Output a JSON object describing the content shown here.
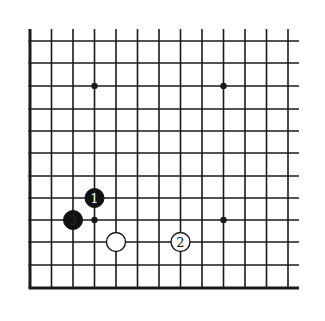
{
  "diagram": {
    "type": "go-board-partial",
    "board_color": "#ffffff",
    "line_color": "#1a1a1a",
    "grid": {
      "x_lines": [
        30,
        51.5,
        73,
        94.5,
        116,
        137.5,
        159,
        180.5,
        202,
        223.5,
        245,
        266.5,
        288
      ],
      "y_lines": [
        41,
        63,
        86,
        109,
        131,
        153,
        176,
        198,
        220,
        242,
        265,
        288
      ],
      "top_edge_y": 29,
      "right_edge_x": 299,
      "open_edges": [
        "top",
        "right"
      ],
      "thick_edges": [
        "left",
        "bottom"
      ]
    },
    "star_points": [
      {
        "col": 3,
        "row": 2
      },
      {
        "col": 9,
        "row": 2
      },
      {
        "col": 3,
        "row": 8
      },
      {
        "col": 9,
        "row": 8
      }
    ],
    "stones": [
      {
        "color": "black",
        "col": 3,
        "row": 7,
        "label": "1"
      },
      {
        "color": "black",
        "col": 2,
        "row": 8,
        "label": "3"
      },
      {
        "color": "white",
        "col": 4,
        "row": 9,
        "label": ""
      },
      {
        "color": "white",
        "col": 7,
        "row": 9,
        "label": "2"
      }
    ]
  }
}
